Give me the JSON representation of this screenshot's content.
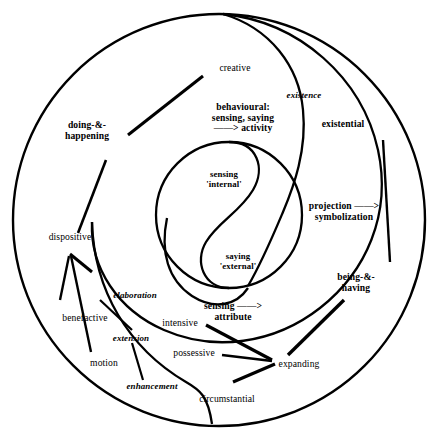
{
  "diagram": {
    "style": {
      "stroke": "#000000",
      "background": "#ffffff"
    },
    "outer_circle": {
      "cx": 219,
      "cy": 220,
      "r": 206
    },
    "inner_circle": {
      "cx": 229,
      "cy": 215,
      "r": 73
    },
    "labels": {
      "creative": "creative",
      "existence": "existence",
      "existential": "existential",
      "behavioural": "behavioural:\nsensing, saying\n——> activity",
      "doing_happening": "doing-&-\nhappening",
      "projection": "projection ——>\nsymbolization",
      "sensing_internal": "sensing\n'internal'",
      "saying_external": "saying\n'external'",
      "dispositive": "dispositive",
      "being_having": "being-&-\nhaving",
      "elaboration": "elaboration",
      "sensing_attribute": "sensing ——>\nattribute",
      "benefactive": "benefactive",
      "intensive": "intensive",
      "extension": "extension",
      "motion": "motion",
      "possessive": "possessive",
      "expanding": "expanding",
      "enhancement": "enhancement",
      "circumstantial": "circumstantial"
    }
  }
}
